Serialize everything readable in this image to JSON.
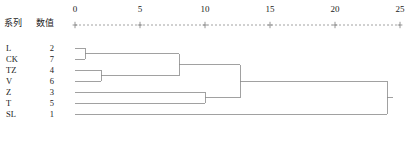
{
  "header": {
    "series_label": "系列",
    "value_label": "数值"
  },
  "axis": {
    "ticks": [
      0,
      5,
      10,
      15,
      20,
      25
    ],
    "min": 0,
    "max": 25,
    "tick_marker": "+",
    "line_style": "dashed",
    "position": "top"
  },
  "leaves": [
    {
      "name": "L",
      "value": "2"
    },
    {
      "name": "CK",
      "value": "7"
    },
    {
      "name": "TZ",
      "value": "4"
    },
    {
      "name": "V",
      "value": "6"
    },
    {
      "name": "Z",
      "value": "3"
    },
    {
      "name": "T",
      "value": "5"
    },
    {
      "name": "SL",
      "value": "1"
    }
  ],
  "colors": {
    "line": "#8a8a8a",
    "text": "#1a1a1a",
    "background": "#ffffff"
  },
  "chart_data": {
    "type": "dendrogram",
    "title": "",
    "xlabel": "",
    "ylabel": "",
    "orientation": "horizontal",
    "xlim": [
      0,
      25
    ],
    "grid": false,
    "legend": "none",
    "tick_labels": [
      "0",
      "5",
      "10",
      "15",
      "20",
      "25"
    ],
    "leaf_order": [
      "L",
      "CK",
      "TZ",
      "V",
      "Z",
      "T",
      "SL"
    ],
    "leaf_labels": [
      "L",
      "CK",
      "TZ",
      "V",
      "Z",
      "T",
      "SL"
    ],
    "leaf_values": [
      2,
      7,
      4,
      6,
      3,
      5,
      1
    ],
    "merges": [
      {
        "id": "m1",
        "left": "L",
        "right": "CK",
        "distance": 0.8,
        "members": [
          "L",
          "CK"
        ]
      },
      {
        "id": "m2",
        "left": "TZ",
        "right": "V",
        "distance": 2.0,
        "members": [
          "TZ",
          "V"
        ]
      },
      {
        "id": "m3",
        "left": "m1",
        "right": "m2",
        "distance": 8.0,
        "members": [
          "L",
          "CK",
          "TZ",
          "V"
        ]
      },
      {
        "id": "m4",
        "left": "Z",
        "right": "T",
        "distance": 10.0,
        "members": [
          "Z",
          "T"
        ]
      },
      {
        "id": "m5",
        "left": "m3",
        "right": "m4",
        "distance": 12.7,
        "members": [
          "L",
          "CK",
          "TZ",
          "V",
          "Z",
          "T"
        ]
      },
      {
        "id": "m6",
        "left": "m5",
        "right": "SL",
        "distance": 24.0,
        "members": [
          "L",
          "CK",
          "TZ",
          "V",
          "Z",
          "T",
          "SL"
        ]
      }
    ]
  }
}
